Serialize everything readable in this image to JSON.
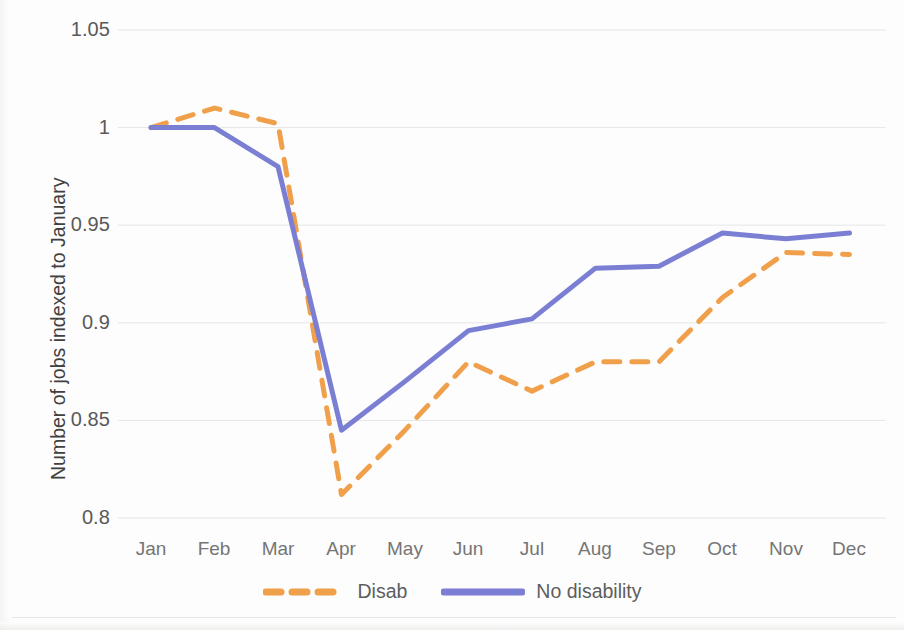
{
  "chart_data": {
    "type": "line",
    "title": "",
    "subtitle": "",
    "xlabel": "",
    "ylabel": "Number of jobs indexed to January",
    "categories": [
      "Jan",
      "Feb",
      "Mar",
      "Apr",
      "May",
      "Jun",
      "Jul",
      "Aug",
      "Sep",
      "Oct",
      "Nov",
      "Dec"
    ],
    "ylim": [
      0.8,
      1.05
    ],
    "ytick_labels": [
      "1.05",
      "1",
      "0.95",
      "0.9",
      "0.85",
      "0.8"
    ],
    "ytick_values": [
      1.05,
      1.0,
      0.95,
      0.9,
      0.85,
      0.8
    ],
    "grid": "horizontal",
    "legend_position": "bottom-center",
    "series": [
      {
        "name": "Disab",
        "color": "#F0A04B",
        "style": "dashed",
        "width": 5,
        "values": [
          1.0,
          1.01,
          1.002,
          0.812,
          0.845,
          0.88,
          0.865,
          0.88,
          0.88,
          0.913,
          0.936,
          0.935
        ]
      },
      {
        "name": "No disability",
        "color": "#7B7FD4",
        "style": "solid",
        "width": 5,
        "values": [
          1.0,
          1.0,
          0.98,
          0.845,
          0.87,
          0.896,
          0.902,
          0.928,
          0.929,
          0.946,
          0.943,
          0.946
        ]
      }
    ]
  },
  "axis": {
    "y_title": "Number of jobs indexed to January",
    "y_ticks": [
      "1.05",
      "1",
      "0.95",
      "0.9",
      "0.85",
      "0.8"
    ],
    "x_ticks": [
      "Jan",
      "Feb",
      "Mar",
      "Apr",
      "May",
      "Jun",
      "Jul",
      "Aug",
      "Sep",
      "Oct",
      "Nov",
      "Dec"
    ]
  },
  "legend": {
    "items": [
      {
        "label": "Disab",
        "color": "#F0A04B",
        "style": "dashed"
      },
      {
        "label": "No disability",
        "color": "#7B7FD4",
        "style": "solid"
      }
    ]
  },
  "colors": {
    "disab": "#F0A04B",
    "no_disability": "#7B7FD4",
    "gridline": "#E6E6E6",
    "tick_text": "#757575",
    "axis_title_text": "#404040",
    "background": "#FDFDFD"
  }
}
